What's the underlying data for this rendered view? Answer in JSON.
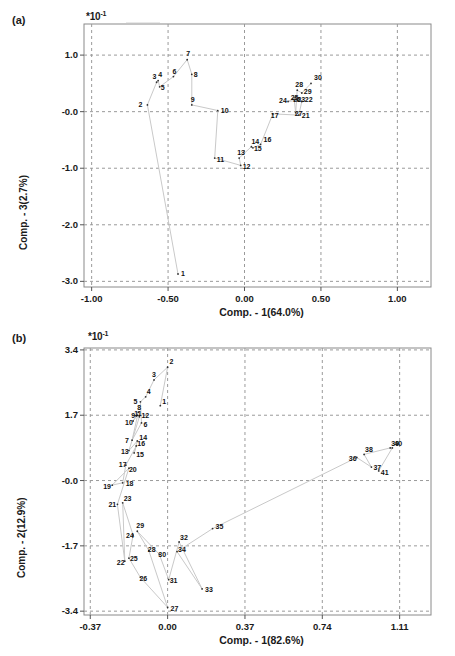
{
  "figure": {
    "panel_a_tag": "(a)",
    "panel_b_tag": "(b)",
    "multiplier_a": "*10",
    "multiplier_a_exp": "-1",
    "multiplier_b": "*10",
    "multiplier_b_exp": "-1"
  },
  "chart_data": [
    {
      "type": "scatter",
      "panel": "(a)",
      "title": "",
      "xlabel": "Comp. - 1(64.0%)",
      "ylabel": "Comp. - 3(2.7%)",
      "xtick_labels": [
        "-1.00",
        "-0.50",
        "0.00",
        "0.50",
        "1.00"
      ],
      "xticks": [
        -1.0,
        -0.5,
        0.0,
        0.5,
        1.0
      ],
      "ytick_labels": [
        "1.0",
        "-0.0",
        "-1.0",
        "-2.0",
        "-3.0"
      ],
      "yticks": [
        1.0,
        0.0,
        -1.0,
        -2.0,
        -3.0
      ],
      "xlim": [
        -1.05,
        1.22
      ],
      "ylim": [
        -3.1,
        1.55
      ],
      "y_multiplier": "*10^-1",
      "grid": true,
      "grid_style": "dashed",
      "legend": "none",
      "connected": true,
      "points": [
        {
          "label": "1",
          "x": -0.435,
          "y": -2.87
        },
        {
          "label": "2",
          "x": -0.635,
          "y": 0.12
        },
        {
          "label": "3",
          "x": -0.575,
          "y": 0.52
        },
        {
          "label": "4",
          "x": -0.565,
          "y": 0.55
        },
        {
          "label": "5",
          "x": -0.555,
          "y": 0.44
        },
        {
          "label": "6",
          "x": -0.465,
          "y": 0.62
        },
        {
          "label": "7",
          "x": -0.375,
          "y": 0.92
        },
        {
          "label": "8",
          "x": -0.345,
          "y": 0.66
        },
        {
          "label": "9",
          "x": -0.345,
          "y": 0.12
        },
        {
          "label": "10",
          "x": -0.175,
          "y": 0.02
        },
        {
          "label": "11",
          "x": -0.195,
          "y": -0.82
        },
        {
          "label": "12",
          "x": -0.025,
          "y": -0.95
        },
        {
          "label": "13",
          "x": -0.035,
          "y": -0.82
        },
        {
          "label": "14",
          "x": 0.045,
          "y": -0.62
        },
        {
          "label": "15",
          "x": 0.055,
          "y": -0.64
        },
        {
          "label": "16",
          "x": 0.105,
          "y": -0.58
        },
        {
          "label": "17",
          "x": 0.185,
          "y": -0.04
        },
        {
          "label": "21",
          "x": 0.355,
          "y": -0.06
        },
        {
          "label": "22",
          "x": 0.375,
          "y": 0.18
        },
        {
          "label": "23",
          "x": 0.345,
          "y": 0.2
        },
        {
          "label": "24",
          "x": 0.285,
          "y": 0.18
        },
        {
          "label": "25",
          "x": 0.315,
          "y": 0.22
        },
        {
          "label": "26",
          "x": 0.325,
          "y": 0.21
        },
        {
          "label": "27",
          "x": 0.335,
          "y": -0.02
        },
        {
          "label": "28",
          "x": 0.345,
          "y": 0.38
        },
        {
          "label": "29",
          "x": 0.375,
          "y": 0.33
        },
        {
          "label": "30",
          "x": 0.435,
          "y": 0.5
        }
      ]
    },
    {
      "type": "scatter",
      "panel": "(b)",
      "title": "",
      "xlabel": "Comp. - 1(82.6%)",
      "ylabel": "Comp. - 2(12.9%)",
      "xtick_labels": [
        "-0.37",
        "0.00",
        "0.37",
        "0.74",
        "1.11"
      ],
      "xticks": [
        -0.37,
        0.0,
        0.37,
        0.74,
        1.11
      ],
      "ytick_labels": [
        "3.4",
        "1.7",
        "-0.0",
        "-1.7",
        "-3.4"
      ],
      "yticks": [
        3.4,
        1.7,
        0.0,
        -1.7,
        -3.4
      ],
      "xlim": [
        -0.4,
        1.26
      ],
      "ylim": [
        -3.5,
        3.45
      ],
      "y_multiplier": "*10^-1",
      "grid": true,
      "grid_style": "dashed",
      "legend": "none",
      "connected": true,
      "points": [
        {
          "label": "1",
          "x": -0.035,
          "y": 1.95
        },
        {
          "label": "2",
          "x": 0.0,
          "y": 2.95
        },
        {
          "label": "3",
          "x": -0.065,
          "y": 2.62
        },
        {
          "label": "4",
          "x": -0.105,
          "y": 2.18
        },
        {
          "label": "5",
          "x": -0.13,
          "y": 2.05
        },
        {
          "label": "6",
          "x": -0.125,
          "y": 1.5
        },
        {
          "label": "7",
          "x": -0.17,
          "y": 1.05
        },
        {
          "label": "8",
          "x": -0.14,
          "y": 1.78
        },
        {
          "label": "9",
          "x": -0.15,
          "y": 1.68
        },
        {
          "label": "10",
          "x": -0.165,
          "y": 1.55
        },
        {
          "label": "11",
          "x": -0.145,
          "y": 1.7
        },
        {
          "label": "12",
          "x": -0.135,
          "y": 1.66
        },
        {
          "label": "13",
          "x": -0.185,
          "y": 0.78
        },
        {
          "label": "14",
          "x": -0.145,
          "y": 1.03
        },
        {
          "label": "15",
          "x": -0.16,
          "y": 0.72
        },
        {
          "label": "16",
          "x": -0.15,
          "y": 0.9
        },
        {
          "label": "17",
          "x": -0.2,
          "y": 0.4
        },
        {
          "label": "18",
          "x": -0.215,
          "y": -0.06
        },
        {
          "label": "19",
          "x": -0.265,
          "y": -0.12
        },
        {
          "label": "20",
          "x": -0.185,
          "y": 0.32
        },
        {
          "label": "21",
          "x": -0.24,
          "y": -0.62
        },
        {
          "label": "23",
          "x": -0.215,
          "y": -0.58
        },
        {
          "label": "22",
          "x": -0.205,
          "y": -2.1
        },
        {
          "label": "24",
          "x": -0.165,
          "y": -1.42
        },
        {
          "label": "25",
          "x": -0.185,
          "y": -2.02
        },
        {
          "label": "26",
          "x": -0.13,
          "y": -2.52
        },
        {
          "label": "27",
          "x": 0.0,
          "y": -3.3
        },
        {
          "label": "28",
          "x": -0.09,
          "y": -1.82
        },
        {
          "label": "29",
          "x": -0.145,
          "y": -1.32
        },
        {
          "label": "30",
          "x": -0.04,
          "y": -1.92
        },
        {
          "label": "31",
          "x": 0.005,
          "y": -2.58
        },
        {
          "label": "32",
          "x": 0.055,
          "y": -1.6
        },
        {
          "label": "33",
          "x": 0.165,
          "y": -2.82
        },
        {
          "label": "34",
          "x": 0.045,
          "y": -1.85
        },
        {
          "label": "35",
          "x": 0.215,
          "y": -1.25
        },
        {
          "label": "36",
          "x": 0.905,
          "y": 0.6
        },
        {
          "label": "37",
          "x": 0.975,
          "y": 0.35
        },
        {
          "label": "38",
          "x": 0.94,
          "y": 0.68
        },
        {
          "label": "39",
          "x": 1.065,
          "y": 0.85
        },
        {
          "label": "40",
          "x": 1.075,
          "y": 0.85
        },
        {
          "label": "41",
          "x": 1.01,
          "y": 0.25
        }
      ]
    }
  ]
}
